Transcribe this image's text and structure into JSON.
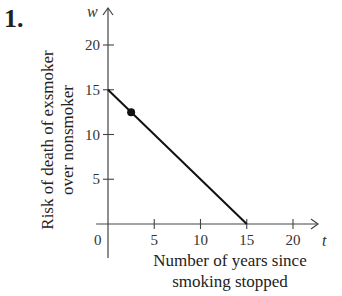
{
  "problem_number": "1.",
  "chart_data": {
    "type": "line",
    "title": "",
    "xlabel": "Number of years since smoking stopped",
    "xlabel_lines": [
      "Number of years since",
      "smoking stopped"
    ],
    "ylabel": "Risk of death of exsmoker over nonsmoker",
    "ylabel_lines": [
      "Risk of death of exsmoker",
      "over nonsmoker"
    ],
    "x_var": "t",
    "y_var": "w",
    "origin_label": "0",
    "x_ticks": [
      5,
      10,
      15,
      20
    ],
    "y_ticks": [
      5,
      10,
      15,
      20
    ],
    "xlim": [
      -1.5,
      22
    ],
    "ylim": [
      -3.5,
      24
    ],
    "grid": false,
    "legend": null,
    "series": [
      {
        "name": "risk line",
        "x": [
          0,
          15
        ],
        "y": [
          15,
          0
        ],
        "color": "#111111"
      }
    ],
    "points": [
      {
        "x": 2.5,
        "y": 12.5,
        "label": ""
      }
    ]
  }
}
